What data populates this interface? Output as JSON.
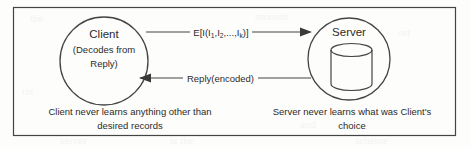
{
  "diagram": {
    "background_color": "#fdfdfc",
    "line_color": "#444444",
    "text_color": "#2b2b2b",
    "border": {
      "label": "outer-frame"
    },
    "nodes": [
      {
        "id": "client",
        "shape": "circle",
        "title": "Client",
        "sub_line_1": "(Decodes from",
        "sub_line_2": "Reply)"
      },
      {
        "id": "server",
        "shape": "circle",
        "title": "Server",
        "inner_shape": "database-cylinder"
      }
    ],
    "edges": [
      {
        "id": "request",
        "direction": "client-to-server",
        "label_prefix": "E[I(I",
        "label_sub_1": "1",
        "label_mid_1": ",I",
        "label_sub_2": "2",
        "label_mid_2": ",...,I",
        "label_sub_3": "k",
        "label_suffix": ")]",
        "label_plain": "E[I(I1,I2,...,Ik)]"
      },
      {
        "id": "reply",
        "direction": "server-to-client",
        "label_plain": "Reply(encoded)"
      }
    ],
    "captions": [
      {
        "id": "client-caption",
        "line_1": "Client never learns anything other than",
        "line_2": "desired records"
      },
      {
        "id": "server-caption",
        "line_1": "Server never learns what was Client's",
        "line_2": "choice"
      }
    ]
  }
}
